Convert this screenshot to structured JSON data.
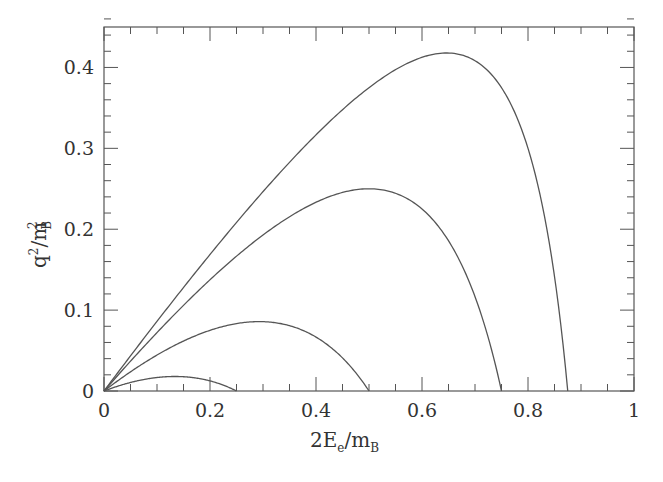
{
  "chart_data": {
    "type": "line",
    "title": "",
    "xlabel": "2E_e/m_B",
    "ylabel": "q^2/m_B^2",
    "xlim": [
      0,
      1
    ],
    "ylim": [
      0,
      0.45
    ],
    "grid": false,
    "legend": null,
    "x_ticks": [
      "0",
      "0.2",
      "0.4",
      "0.6",
      "0.8",
      "1"
    ],
    "y_ticks": [
      "0",
      "0.1",
      "0.2",
      "0.3",
      "0.4"
    ],
    "x_minor_step": 0.05,
    "y_minor_step": 0.02,
    "series": [
      {
        "name": "curve-1",
        "endpoint_x": 0.875,
        "peak": {
          "x": 0.65,
          "y": 0.414
        },
        "x": [
          0,
          0.1,
          0.2,
          0.3,
          0.4,
          0.5,
          0.6,
          0.65,
          0.7,
          0.75,
          0.8,
          0.85,
          0.875
        ],
        "values": [
          0,
          0.086,
          0.169,
          0.246,
          0.317,
          0.375,
          0.413,
          0.418,
          0.408,
          0.375,
          0.3,
          0.142,
          0
        ]
      },
      {
        "name": "curve-2",
        "endpoint_x": 0.75,
        "peak": {
          "x": 0.5,
          "y": 0.25
        },
        "x": [
          0,
          0.1,
          0.2,
          0.3,
          0.4,
          0.5,
          0.6,
          0.65,
          0.7,
          0.75
        ],
        "values": [
          0,
          0.072,
          0.138,
          0.193,
          0.233,
          0.25,
          0.225,
          0.186,
          0.117,
          0
        ]
      },
      {
        "name": "curve-3",
        "endpoint_x": 0.5,
        "peak": {
          "x": 0.29,
          "y": 0.086
        },
        "x": [
          0,
          0.1,
          0.2,
          0.29,
          0.35,
          0.4,
          0.45,
          0.5
        ],
        "values": [
          0,
          0.044,
          0.075,
          0.086,
          0.081,
          0.067,
          0.041,
          0
        ]
      },
      {
        "name": "curve-4",
        "endpoint_x": 0.25,
        "peak": {
          "x": 0.13,
          "y": 0.018
        },
        "x": [
          0,
          0.05,
          0.1,
          0.13,
          0.17,
          0.2,
          0.25
        ],
        "values": [
          0,
          0.011,
          0.017,
          0.018,
          0.016,
          0.0125,
          0
        ]
      }
    ],
    "note": "Kinematic boundary curves q^2 = x(1 - r^2 - x)/(1 - x) with r^2 = 0.125, 0.25, 0.5, 0.75"
  },
  "axes": {
    "x_label_main": "2E",
    "x_label_sub": "e",
    "x_label_slash": "/m",
    "x_label_sub2": "B",
    "y_label_main": "q",
    "y_label_sup": "2",
    "y_label_slash": "/m",
    "y_label_sub": "B",
    "y_label_sup2": "2"
  }
}
